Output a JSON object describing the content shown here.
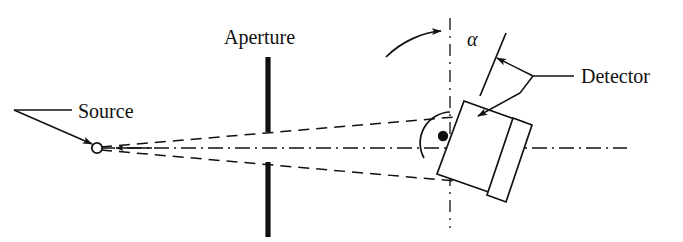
{
  "figure": {
    "type": "optical-setup-schematic",
    "background_color": "#ffffff",
    "line_color": "#111111"
  },
  "labels": {
    "source": "Source",
    "aperture": "Aperture",
    "detector": "Detector",
    "angle": "α"
  },
  "components": {
    "source": {
      "name": "Source",
      "marker": "open-circle",
      "x": 97,
      "y": 148
    },
    "aperture": {
      "name": "Aperture",
      "marker": "two-vertical-bars",
      "x": 268,
      "top_bar": [
        57,
        132
      ],
      "bottom_bar": [
        162,
        237
      ],
      "gap": [
        132,
        162
      ]
    },
    "detector": {
      "name": "Detector",
      "marker": "rotated-box-with-plate",
      "pivot_x": 450,
      "pivot_y": 143,
      "rotation_label": "α"
    },
    "optical_axis": {
      "name": "optical-axis",
      "style": "dash-dot",
      "y": 148,
      "x_start": 100,
      "x_end": 627
    },
    "rotation_axis": {
      "name": "rotation-reference-axis",
      "style": "dash-dot",
      "x": 450,
      "y_start": 18,
      "y_end": 228
    },
    "beam": {
      "name": "diverging-beam",
      "style": "dashed",
      "upper_end": [
        455,
        118
      ],
      "lower_end": [
        455,
        180
      ]
    }
  },
  "annotations": {
    "rotation_arrow": "curved-arrow-indicating-rotation",
    "pivot_dot": "filled-pivot-point",
    "pivot_arc": "arc-around-pivot",
    "source_leader": "leader-line-to-source",
    "detector_leader": "leader-line-to-detector",
    "beam_direction_arrow": "arrow-pointing-to-source"
  }
}
